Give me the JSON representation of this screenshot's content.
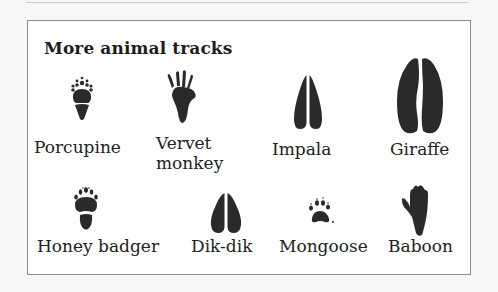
{
  "title": "More animal tracks",
  "tracks": [
    {
      "name": "Porcupine",
      "icon": "porcupine-track-icon"
    },
    {
      "name": "Vervet",
      "name_line2": "monkey",
      "icon": "vervet-monkey-track-icon"
    },
    {
      "name": "Impala",
      "icon": "impala-track-icon"
    },
    {
      "name": "Giraffe",
      "icon": "giraffe-track-icon"
    },
    {
      "name": "Honey badger",
      "icon": "honey-badger-track-icon"
    },
    {
      "name": "Dik-dik",
      "icon": "dik-dik-track-icon"
    },
    {
      "name": "Mongoose",
      "icon": "mongoose-track-icon"
    },
    {
      "name": "Baboon",
      "icon": "baboon-track-icon"
    }
  ],
  "colors": {
    "ink": "#2a2a2a",
    "frame": "#8d8d8d",
    "background": "#ffffff"
  }
}
